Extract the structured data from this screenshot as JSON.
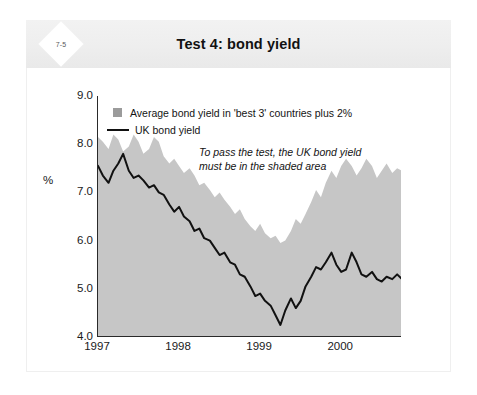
{
  "header": {
    "badge": "7-5",
    "title": "Test 4: bond yield"
  },
  "chart_data": {
    "type": "area",
    "title": "Test 4: bond yield",
    "xlabel": "",
    "ylabel": "%",
    "ylim": [
      4.0,
      9.0
    ],
    "ytick_labels": [
      "9.0",
      "8.0",
      "7.0",
      "6.0",
      "5.0",
      "4.0"
    ],
    "ytick_values": [
      9.0,
      8.0,
      7.0,
      6.0,
      5.0,
      4.0
    ],
    "xlim": [
      1997.0,
      2000.75
    ],
    "xtick_labels": [
      "1997",
      "1998",
      "1999",
      "2000"
    ],
    "xtick_values": [
      1997,
      1998,
      1999,
      2000
    ],
    "grid": false,
    "legend_position": "top-left",
    "annotation": "To pass the test, the UK bond yield must be in the shaded area",
    "annotation_line_1": "To pass the test, the UK bond yield",
    "annotation_line_2": "must be in the shaded area",
    "colors": {
      "shaded_area": "#c6c6c6",
      "uk_line": "#111111",
      "axis": "#2a2a2a",
      "header_band": "#eeeeee",
      "card": "#ffffff"
    },
    "series": [
      {
        "name": "Average bond yield in 'best 3' countries plus 2%",
        "type": "area",
        "fill": "#c6c6c6",
        "legend_marker": "square",
        "x": [
          1997.0,
          1997.06,
          1997.13,
          1997.19,
          1997.25,
          1997.31,
          1997.38,
          1997.44,
          1997.5,
          1997.56,
          1997.63,
          1997.69,
          1997.75,
          1997.81,
          1997.88,
          1997.94,
          1998.0,
          1998.06,
          1998.13,
          1998.19,
          1998.25,
          1998.31,
          1998.38,
          1998.44,
          1998.5,
          1998.56,
          1998.63,
          1998.69,
          1998.75,
          1998.81,
          1998.88,
          1998.94,
          1999.0,
          1999.06,
          1999.13,
          1999.19,
          1999.25,
          1999.31,
          1999.38,
          1999.44,
          1999.5,
          1999.56,
          1999.63,
          1999.69,
          1999.75,
          1999.81,
          1999.88,
          1999.94,
          2000.0,
          2000.06,
          2000.13,
          2000.19,
          2000.25,
          2000.31,
          2000.38,
          2000.44,
          2000.5,
          2000.56,
          2000.63,
          2000.69,
          2000.75
        ],
        "y": [
          8.15,
          8.05,
          7.9,
          8.2,
          8.1,
          7.85,
          7.95,
          8.2,
          8.05,
          7.8,
          7.9,
          8.15,
          8.05,
          7.75,
          7.6,
          7.7,
          7.55,
          7.4,
          7.5,
          7.35,
          7.15,
          7.2,
          7.05,
          6.9,
          7.0,
          6.85,
          6.7,
          6.55,
          6.65,
          6.45,
          6.3,
          6.2,
          6.35,
          6.15,
          6.05,
          6.1,
          5.95,
          6.0,
          6.2,
          6.45,
          6.35,
          6.55,
          6.8,
          7.05,
          6.9,
          7.2,
          7.45,
          7.3,
          7.55,
          7.7,
          7.55,
          7.35,
          7.5,
          7.7,
          7.55,
          7.3,
          7.45,
          7.6,
          7.4,
          7.5,
          7.45
        ]
      },
      {
        "name": "UK bond yield",
        "type": "line",
        "color": "#111111",
        "legend_marker": "line",
        "x": [
          1997.0,
          1997.06,
          1997.13,
          1997.19,
          1997.25,
          1997.31,
          1997.38,
          1997.44,
          1997.5,
          1997.56,
          1997.63,
          1997.69,
          1997.75,
          1997.81,
          1997.88,
          1997.94,
          1998.0,
          1998.06,
          1998.13,
          1998.19,
          1998.25,
          1998.31,
          1998.38,
          1998.44,
          1998.5,
          1998.56,
          1998.63,
          1998.69,
          1998.75,
          1998.81,
          1998.88,
          1998.94,
          1999.0,
          1999.06,
          1999.13,
          1999.19,
          1999.25,
          1999.31,
          1999.38,
          1999.44,
          1999.5,
          1999.56,
          1999.63,
          1999.69,
          1999.75,
          1999.81,
          1999.88,
          1999.94,
          2000.0,
          2000.06,
          2000.13,
          2000.19,
          2000.25,
          2000.31,
          2000.38,
          2000.44,
          2000.5,
          2000.56,
          2000.63,
          2000.69,
          2000.75
        ],
        "y": [
          7.55,
          7.35,
          7.2,
          7.45,
          7.6,
          7.8,
          7.45,
          7.3,
          7.35,
          7.25,
          7.1,
          7.15,
          7.0,
          6.95,
          6.75,
          6.6,
          6.7,
          6.5,
          6.4,
          6.2,
          6.25,
          6.05,
          6.0,
          5.85,
          5.7,
          5.75,
          5.55,
          5.5,
          5.3,
          5.25,
          5.05,
          4.85,
          4.9,
          4.75,
          4.65,
          4.45,
          4.25,
          4.55,
          4.8,
          4.6,
          4.75,
          5.05,
          5.25,
          5.45,
          5.4,
          5.55,
          5.75,
          5.5,
          5.35,
          5.4,
          5.75,
          5.55,
          5.3,
          5.25,
          5.35,
          5.2,
          5.15,
          5.25,
          5.2,
          5.3,
          5.2
        ]
      }
    ]
  },
  "legend": {
    "item_area_label": "Average bond yield in 'best 3' countries plus 2%",
    "item_line_label": "UK bond yield"
  }
}
